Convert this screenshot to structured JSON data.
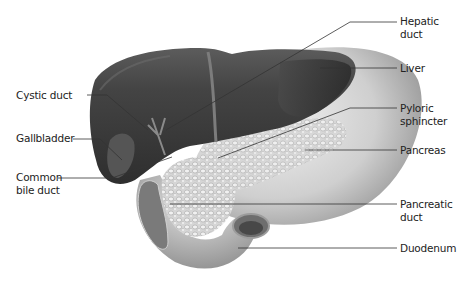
{
  "diagram": {
    "colors": {
      "liver": "#3a3a3a",
      "stomach": "#bdbdbd",
      "pancreas": "#d9d9d9",
      "leader_line": "#333333",
      "text": "#222222"
    },
    "labels_left": [
      {
        "id": "cystic-duct",
        "lines": [
          "Cystic duct"
        ]
      },
      {
        "id": "gallbladder",
        "lines": [
          "Gallbladder"
        ]
      },
      {
        "id": "common-bile-duct",
        "lines": [
          "Common",
          "bile duct"
        ]
      }
    ],
    "labels_right": [
      {
        "id": "hepatic-duct",
        "lines": [
          "Hepatic",
          "duct"
        ]
      },
      {
        "id": "liver",
        "lines": [
          "Liver"
        ]
      },
      {
        "id": "pyloric-sphincter",
        "lines": [
          "Pyloric",
          "sphincter"
        ]
      },
      {
        "id": "pancreas",
        "lines": [
          "Pancreas"
        ]
      },
      {
        "id": "pancreatic-duct",
        "lines": [
          "Pancreatic",
          "duct"
        ]
      },
      {
        "id": "duodenum",
        "lines": [
          "Duodenum"
        ]
      }
    ]
  }
}
